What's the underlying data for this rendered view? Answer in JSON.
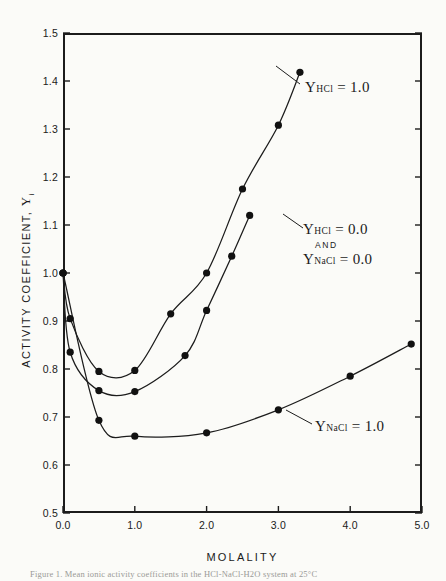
{
  "figure": {
    "caption": "Figure 1.   Mean ionic activity coefficients in the HCl-NaCl-H2O system at 25°C"
  },
  "axes": {
    "ylabel_text": "ACTIVITY COEFFICIENT, ",
    "ylabel_symbol": "Υ",
    "ylabel_subscript": "i",
    "xlabel": "MOLALITY",
    "yticks": [
      "0.5",
      "0.6",
      "0.7",
      "0.8",
      "0.9",
      "1.0",
      "1.1",
      "1.2",
      "1.3",
      "1.4",
      "1.5"
    ],
    "xticks": [
      "0.0",
      "1.0",
      "2.0",
      "3.0",
      "4.0",
      "5.0"
    ]
  },
  "annotations": {
    "hcl_1": {
      "symbol": "Υ",
      "sub": "HCl",
      "value": "= 1.0"
    },
    "mixed": {
      "symbol": "Υ",
      "sub_a": "HCl",
      "value_a": "= 0.0",
      "and": "AND",
      "sub_b": "NaCl",
      "value_b": "= 0.0"
    },
    "nacl_1": {
      "symbol": "Υ",
      "sub": "NaCl",
      "value": "= 1.0"
    }
  },
  "colors": {
    "ink": "#1c1c1c",
    "paper": "#fbfbf8",
    "marker": "#111111"
  },
  "chart_data": {
    "type": "line",
    "title": "",
    "xlabel": "MOLALITY",
    "ylabel": "ACTIVITY COEFFICIENT, Υi",
    "xlim": [
      0.0,
      5.0
    ],
    "ylim": [
      0.5,
      1.5
    ],
    "grid": false,
    "legend": "inline-annotations",
    "markers": "filled-circle",
    "series": [
      {
        "name": "Υ_HCl = 1.0",
        "x": [
          0.0,
          0.1,
          0.5,
          1.0,
          1.5,
          2.0,
          2.5,
          3.0,
          3.3
        ],
        "y": [
          1.0,
          0.905,
          0.795,
          0.797,
          0.915,
          1.0,
          1.175,
          1.308,
          1.418
        ]
      },
      {
        "name": "Υ_HCl = 0.0 and Υ_NaCl = 0.0",
        "x": [
          0.0,
          0.1,
          0.5,
          1.0,
          1.7,
          2.0,
          2.35,
          2.6
        ],
        "y": [
          1.0,
          0.835,
          0.755,
          0.753,
          0.828,
          0.922,
          1.035,
          1.12
        ]
      },
      {
        "name": "Υ_NaCl = 1.0",
        "x": [
          0.0,
          0.5,
          1.0,
          2.0,
          3.0,
          4.0,
          4.85
        ],
        "y": [
          1.0,
          0.693,
          0.66,
          0.667,
          0.715,
          0.785,
          0.852
        ]
      }
    ]
  }
}
